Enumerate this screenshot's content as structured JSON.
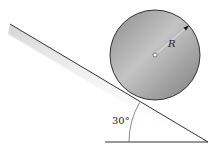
{
  "diagram": {
    "radius_label": "R",
    "angle_label": "30°",
    "angle_degrees": 30,
    "colors": {
      "disk_fill": "#9a9a9a",
      "disk_highlight": "#c8c8c8",
      "outline": "#333333",
      "incline_shade": "#cfcfcf"
    }
  }
}
